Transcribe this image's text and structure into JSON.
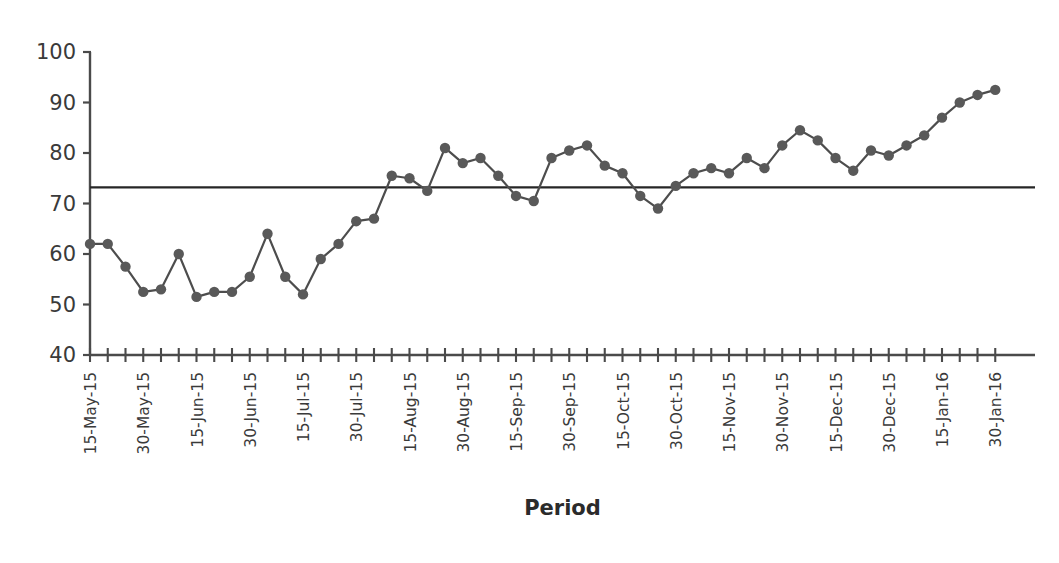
{
  "chart_data": {
    "type": "line",
    "title": "",
    "subtitle": "",
    "xlabel": "Period",
    "ylabel": "",
    "ylim": [
      40,
      100
    ],
    "ytick_values": [
      40,
      50,
      60,
      70,
      80,
      90,
      100
    ],
    "ytick_labels": [
      "40",
      "50",
      "60",
      "70",
      "80",
      "90",
      "100"
    ],
    "grid": false,
    "legend_position": "none",
    "line_color": "#4d4d4d",
    "marker_color": "#595959",
    "axis_color": "#4a4a4a",
    "reference_line": {
      "label": "",
      "value": 73.2,
      "color": "#262626",
      "style": "solid"
    },
    "x_tick_labels": [
      "15-May-15",
      "",
      "",
      "30-May-15",
      "",
      "",
      "15-Jun-15",
      "",
      "",
      "30-Jun-15",
      "",
      "",
      "15-Jul-15",
      "",
      "",
      "30-Jul-15",
      "",
      "",
      "15-Aug-15",
      "",
      "",
      "30-Aug-15",
      "",
      "",
      "15-Sep-15",
      "",
      "",
      "30-Sep-15",
      "",
      "",
      "15-Oct-15",
      "",
      "",
      "30-Oct-15",
      "",
      "",
      "15-Nov-15",
      "",
      "",
      "30-Nov-15",
      "",
      "",
      "15-Dec-15",
      "",
      "",
      "30-Dec-15",
      "",
      "",
      "15-Jan-16",
      "",
      "",
      "30-Jan-16"
    ],
    "visible_x_labels": [
      "15-May-15",
      "30-May-15",
      "15-Jun-15",
      "30-Jun-15",
      "15-Jul-15",
      "30-Jul-15",
      "15-Aug-15",
      "30-Aug-15",
      "15-Sep-15",
      "30-Sep-15",
      "15-Oct-15",
      "30-Oct-15",
      "15-Nov-15",
      "30-Nov-15",
      "15-Dec-15",
      "30-Dec-15",
      "15-Jan-16",
      "30-Jan-16"
    ],
    "categories": [
      "15-May-15",
      "20-May-15",
      "25-May-15",
      "30-May-15",
      "04-Jun-15",
      "09-Jun-15",
      "15-Jun-15",
      "20-Jun-15",
      "25-Jun-15",
      "30-Jun-15",
      "05-Jul-15",
      "10-Jul-15",
      "15-Jul-15",
      "20-Jul-15",
      "25-Jul-15",
      "30-Jul-15",
      "04-Aug-15",
      "09-Aug-15",
      "15-Aug-15",
      "20-Aug-15",
      "25-Aug-15",
      "30-Aug-15",
      "04-Sep-15",
      "09-Sep-15",
      "15-Sep-15",
      "20-Sep-15",
      "25-Sep-15",
      "30-Sep-15",
      "05-Oct-15",
      "10-Oct-15",
      "15-Oct-15",
      "20-Oct-15",
      "25-Oct-15",
      "30-Oct-15",
      "04-Nov-15",
      "09-Nov-15",
      "15-Nov-15",
      "20-Nov-15",
      "25-Nov-15",
      "30-Nov-15",
      "05-Dec-15",
      "10-Dec-15",
      "15-Dec-15",
      "20-Dec-15",
      "25-Dec-15",
      "30-Dec-15",
      "04-Jan-16",
      "09-Jan-16",
      "15-Jan-16",
      "20-Jan-16",
      "25-Jan-16",
      "30-Jan-16"
    ],
    "values": [
      62,
      62,
      57.5,
      52.5,
      53,
      60,
      51.5,
      52.5,
      52.5,
      55.5,
      64,
      55.5,
      52,
      59,
      62,
      66.5,
      67,
      75.5,
      75,
      72.5,
      81,
      78,
      79,
      75.5,
      71.5,
      70.5,
      79,
      80.5,
      81.5,
      77.5,
      76,
      71.5,
      69,
      73.5,
      76,
      77,
      76,
      79,
      77,
      81.5,
      84.5,
      82.5,
      79,
      76.5,
      80.5,
      79.5,
      81.5,
      83.5,
      87,
      90,
      91.5,
      92.5
    ],
    "series": [
      {
        "name": "Measurement",
        "values": [
          62,
          62,
          57.5,
          52.5,
          53,
          60,
          51.5,
          52.5,
          52.5,
          55.5,
          64,
          55.5,
          52,
          59,
          62,
          66.5,
          67,
          75.5,
          75,
          72.5,
          81,
          78,
          79,
          75.5,
          71.5,
          70.5,
          79,
          80.5,
          81.5,
          77.5,
          76,
          71.5,
          69,
          73.5,
          76,
          77,
          76,
          79,
          77,
          81.5,
          84.5,
          82.5,
          79,
          76.5,
          80.5,
          79.5,
          81.5,
          83.5,
          87,
          90,
          91.5,
          92.5
        ]
      }
    ],
    "annotations": []
  },
  "axes": {
    "x_title": "Period"
  }
}
